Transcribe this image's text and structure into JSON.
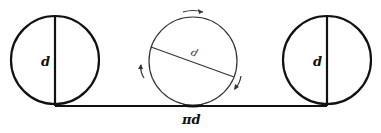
{
  "diagram": {
    "left_circle": {
      "label": "d",
      "center": [
        55,
        60
      ],
      "radius": 43
    },
    "middle_circle": {
      "label": "d",
      "center": [
        193,
        60
      ],
      "radius": 44,
      "rotation": "clockwise"
    },
    "right_circle": {
      "label": "d",
      "center": [
        327,
        60
      ],
      "radius": 43
    },
    "baseline": {
      "label": "πd",
      "from": [
        55,
        106
      ],
      "to": [
        327,
        106
      ]
    },
    "colors": {
      "stroke": "#111111",
      "background": "#ffffff"
    }
  }
}
